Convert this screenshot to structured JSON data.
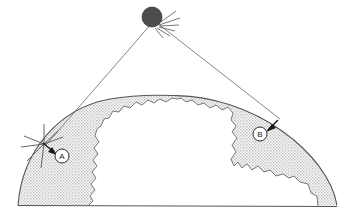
{
  "figure": {
    "type": "schematic-diagram",
    "title": "",
    "background_color": "#ffffff",
    "line_color": "#333333",
    "shade_color": "#d6d6d6",
    "burst_color": "#4a4a4a"
  },
  "elements": {
    "burst": {
      "name": "high-altitude-burst",
      "label": "",
      "center_x": 152,
      "center_y": 17,
      "radius": 10
    },
    "point_a": {
      "label": "A",
      "circle_x": 62,
      "circle_y": 156,
      "circle_r": 7
    },
    "point_b": {
      "label": "B",
      "circle_x": 260,
      "circle_y": 134,
      "circle_r": 7
    },
    "ground_line": {
      "name": "ground-baseline",
      "x1": 18,
      "y1": 205,
      "x2": 337,
      "y2": 206
    },
    "ray_left": {
      "name": "line-of-sight-to-a",
      "x1": 152,
      "y1": 22,
      "x2": 44,
      "y2": 146
    },
    "ray_right": {
      "name": "line-of-sight-to-b",
      "x1": 156,
      "y1": 22,
      "x2": 279,
      "y2": 119
    }
  },
  "shading": {
    "name": "affected-region-band",
    "description": "stippled band between earth surface arc and irregular inner boundary"
  }
}
